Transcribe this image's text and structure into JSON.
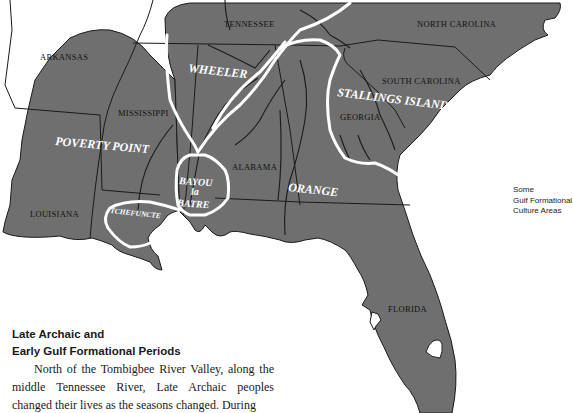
{
  "map": {
    "state_labels": [
      {
        "name": "ARKANSAS",
        "x": 40,
        "y": 60
      },
      {
        "name": "TENNESSEE",
        "x": 224,
        "y": 27
      },
      {
        "name": "NORTH CAROLINA",
        "x": 417,
        "y": 27
      },
      {
        "name": "MISSISSIPPI",
        "x": 118,
        "y": 116
      },
      {
        "name": "SOUTH CAROLINA",
        "x": 382,
        "y": 84
      },
      {
        "name": "GEORGIA",
        "x": 340,
        "y": 120
      },
      {
        "name": "ALABAMA",
        "x": 232,
        "y": 170
      },
      {
        "name": "LOUISIANA",
        "x": 30,
        "y": 217
      },
      {
        "name": "FLORIDA",
        "x": 388,
        "y": 312
      }
    ],
    "culture_labels": [
      {
        "name": "WHEELER",
        "x": 188,
        "y": 72,
        "size": 12,
        "rotate": 6
      },
      {
        "name": "STALLINGS ISLAND",
        "x": 337,
        "y": 96,
        "size": 12,
        "rotate": 7
      },
      {
        "name": "POVERTY POINT",
        "x": 55,
        "y": 145,
        "size": 12,
        "rotate": 5
      },
      {
        "name": "BAYOU",
        "x": 179,
        "y": 184,
        "size": 10,
        "rotate": 4
      },
      {
        "name": "la",
        "x": 191,
        "y": 195,
        "size": 10,
        "rotate": 0
      },
      {
        "name": "BATRE",
        "x": 177,
        "y": 206,
        "size": 10,
        "rotate": 4
      },
      {
        "name": "ORANGE",
        "x": 288,
        "y": 191,
        "size": 12,
        "rotate": 6
      },
      {
        "name": "TCHEFUNCTE",
        "x": 110,
        "y": 213,
        "size": 7.5,
        "rotate": 6
      }
    ],
    "colors": {
      "land": "#6f6f6f",
      "border": "#1a1a1a",
      "culture_boundary": "#ffffff",
      "water": "#ffffff"
    }
  },
  "legend": {
    "line1": "Some",
    "line2": "Gulf Formational",
    "line3": "Culture Areas"
  },
  "article": {
    "heading_line1": "Late Archaic and",
    "heading_line2": "Early Gulf Formational Periods",
    "body": "North of the Tombigbee River Valley, along the middle Tennessee River, Late Archaic peoples changed their lives as the seasons changed. During"
  }
}
